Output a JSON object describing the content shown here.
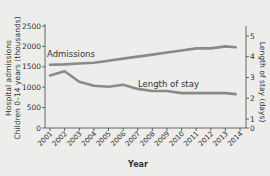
{
  "chart_data": {
    "type": "line",
    "title": "",
    "xlabel": "Year",
    "ylabel": "Hospital admissions Children 0–14 years (thousands)",
    "y2label": "Length of stay (days)",
    "categories": [
      "2001",
      "2002",
      "2003",
      "2004",
      "2005",
      "2006",
      "2007",
      "2008",
      "2009",
      "2010",
      "2011",
      "2012",
      "2013",
      "2014"
    ],
    "ylim": [
      0,
      2500
    ],
    "y2lim": [
      0,
      5
    ],
    "yticks": [
      0,
      500,
      1000,
      1500,
      2000,
      2500
    ],
    "y2ticks": [
      0,
      1,
      2,
      3,
      4,
      5
    ],
    "grid": false,
    "legend": "inline labels",
    "series": [
      {
        "name": "Admissions",
        "axis": "left",
        "color": "#8a8a8a",
        "values": [
          1550,
          1560,
          1580,
          1600,
          1650,
          1700,
          1750,
          1800,
          1850,
          1900,
          1950,
          1950,
          2000,
          1980
        ]
      },
      {
        "name": "Length of stay",
        "axis": "right",
        "color": "#8a8a8a",
        "values": [
          3.1,
          3.3,
          2.8,
          2.6,
          2.55,
          2.65,
          2.45,
          2.35,
          2.35,
          2.25,
          2.25,
          2.25,
          2.25,
          2.2
        ]
      }
    ]
  },
  "labels": {
    "admissions": "Admissions",
    "length_of_stay": "Length of stay",
    "xlabel": "Year",
    "ylabel_line1": "Hospital admissions",
    "ylabel_line2": "Children 0–14 years (thousands)",
    "y2label": "Length of stay (days)"
  }
}
